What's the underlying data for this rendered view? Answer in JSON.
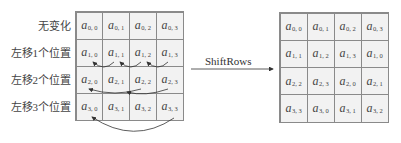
{
  "row_labels": [
    "无变化",
    "左移1个位置",
    "左移2个位置",
    "左移3个位置"
  ],
  "operation_label": "ShiftRows",
  "left_grid": {
    "rows": [
      [
        {
          "b": "a",
          "s": "0, 0"
        },
        {
          "b": "a",
          "s": "0, 1"
        },
        {
          "b": "a",
          "s": "0, 2"
        },
        {
          "b": "a",
          "s": "0, 3"
        }
      ],
      [
        {
          "b": "a",
          "s": "1, 0"
        },
        {
          "b": "a",
          "s": "1, 1"
        },
        {
          "b": "a",
          "s": "1, 2"
        },
        {
          "b": "a",
          "s": "1, 3"
        }
      ],
      [
        {
          "b": "a",
          "s": "2, 0"
        },
        {
          "b": "a",
          "s": "2, 1"
        },
        {
          "b": "a",
          "s": "2, 2"
        },
        {
          "b": "a",
          "s": "2, 3"
        }
      ],
      [
        {
          "b": "a",
          "s": "3, 0"
        },
        {
          "b": "a",
          "s": "3, 1"
        },
        {
          "b": "a",
          "s": "3, 2"
        },
        {
          "b": "a",
          "s": "3, 3"
        }
      ]
    ]
  },
  "right_grid": {
    "rows": [
      [
        {
          "b": "a",
          "s": "0, 0"
        },
        {
          "b": "a",
          "s": "0, 1"
        },
        {
          "b": "a",
          "s": "0, 2"
        },
        {
          "b": "a",
          "s": "0, 3"
        }
      ],
      [
        {
          "b": "a",
          "s": "1, 1"
        },
        {
          "b": "a",
          "s": "1, 2"
        },
        {
          "b": "a",
          "s": "1, 3"
        },
        {
          "b": "a",
          "s": "1, 0"
        }
      ],
      [
        {
          "b": "a",
          "s": "2, 2"
        },
        {
          "b": "a",
          "s": "2, 3"
        },
        {
          "b": "a",
          "s": "2, 0"
        },
        {
          "b": "a",
          "s": "2, 1"
        }
      ],
      [
        {
          "b": "a",
          "s": "3, 3"
        },
        {
          "b": "a",
          "s": "3, 0"
        },
        {
          "b": "a",
          "s": "3, 1"
        },
        {
          "b": "a",
          "s": "3, 2"
        }
      ]
    ]
  },
  "colors": {
    "cell_fill": "#f2f2f2",
    "grid_line": "#8a8a8a",
    "text": "#444444"
  }
}
